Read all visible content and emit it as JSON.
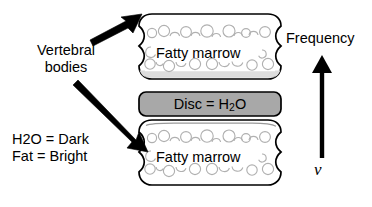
{
  "diagram": {
    "background_color": "#ffffff",
    "stroke_color": "#000000"
  },
  "labels": {
    "vertebral_bodies_line1": "Vertebral",
    "vertebral_bodies_line2": "bodies",
    "signal_note_line1": "H2O = Dark",
    "signal_note_line2": "Fat = Bright",
    "frequency": "Frequency",
    "nu_symbol": "ν"
  },
  "vertebral_body_top": {
    "tissue_label": "Fatty marrow",
    "fill_color": "#ffffff",
    "endplate_color": "#d9d9d9",
    "cell_stroke_color": "#b3b3b3"
  },
  "vertebral_body_bottom": {
    "tissue_label": "Fatty marrow",
    "fill_color": "#ffffff",
    "endplate_color": "#e6e6e6",
    "cell_stroke_color": "#b3b3b3"
  },
  "disc": {
    "label_prefix": "Disc = H",
    "label_subscript": "2",
    "label_suffix": "O",
    "fill_color": "#a8a8a8",
    "stroke_color": "#000000"
  },
  "frequency_axis": {
    "direction": "up",
    "top_label": "Frequency",
    "bottom_label": "ν",
    "color": "#000000"
  },
  "pointer_arrows": [
    {
      "name": "arrow-to-top-vertebral-body",
      "direction": "up-right"
    },
    {
      "name": "arrow-to-bottom-vertebral-body",
      "direction": "down-right"
    }
  ]
}
